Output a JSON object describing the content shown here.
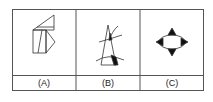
{
  "figures": [
    {
      "label": "(A)",
      "description": "cube with triangular flap and pentagon"
    },
    {
      "label": "(B)",
      "description": "triangle crossed by curves with shaded regions"
    },
    {
      "label": "(C)",
      "description": "ellipse with four triangular points"
    }
  ],
  "colors": {
    "line": "#333333",
    "fill": "#111111",
    "background": "#ffffff"
  }
}
